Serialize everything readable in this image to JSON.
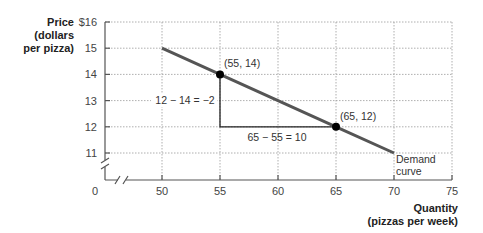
{
  "chart_data": {
    "type": "line",
    "title": "",
    "ylabel": [
      "Price",
      "(dollars",
      "per pizza)"
    ],
    "xlabel": [
      "Quantity",
      "(pizzas per week)"
    ],
    "y_ticks": [
      "$16",
      "15",
      "14",
      "13",
      "12",
      "11"
    ],
    "y_tick_values": [
      16,
      15,
      14,
      13,
      12,
      11
    ],
    "x_ticks": [
      "50",
      "55",
      "60",
      "65",
      "70",
      "75"
    ],
    "x_tick_values": [
      50,
      55,
      60,
      65,
      70,
      75
    ],
    "origin_label": "0",
    "xlim": [
      50,
      75
    ],
    "ylim": [
      11,
      16
    ],
    "axis_breaks": true,
    "grid": true,
    "series": [
      {
        "name": "Demand curve",
        "x": [
          50,
          55,
          60,
          65,
          70
        ],
        "y": [
          15,
          14,
          13,
          12,
          11
        ],
        "color": "#555555"
      }
    ],
    "points": [
      {
        "x": 55,
        "y": 14,
        "label": "(55, 14)"
      },
      {
        "x": 65,
        "y": 12,
        "label": "(65, 12)"
      }
    ],
    "annotations": {
      "rise": "12 − 14 = −2",
      "run": "65 − 55 = 10",
      "curve_label": [
        "Demand",
        "curve"
      ]
    }
  }
}
